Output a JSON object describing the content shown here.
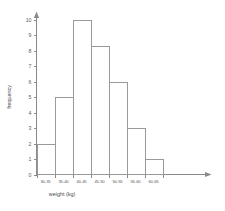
{
  "chart_data": {
    "type": "bar",
    "title": "",
    "subtitle": "",
    "xlabel": "weight (kg)",
    "ylabel": "frequency",
    "categories": [
      "30-35",
      "35-40",
      "40-45",
      "45-50",
      "50-55",
      "55-60",
      "60-65"
    ],
    "values": [
      2,
      5,
      10,
      8.3,
      6,
      3,
      1
    ],
    "series": [
      {
        "name": "frequency",
        "values": [
          2,
          5,
          10,
          8.3,
          6,
          3,
          1
        ]
      }
    ],
    "ylim": [
      0,
      10
    ],
    "ytick_labels": [
      "0",
      "1",
      "2",
      "3",
      "4",
      "5",
      "6",
      "7",
      "8",
      "9",
      "10"
    ],
    "ytick_values": [
      0,
      1,
      2,
      3,
      4,
      5,
      6,
      7,
      8,
      9,
      10
    ],
    "grid": false,
    "legend": false,
    "legend_position": "none",
    "bar_style": "outline",
    "bar_fill": "#ffffff",
    "bar_stroke": "#9a9a9a",
    "axis_color": "#8a8a8a",
    "background": "#ffffff",
    "axis_arrows": true,
    "annotations": []
  }
}
